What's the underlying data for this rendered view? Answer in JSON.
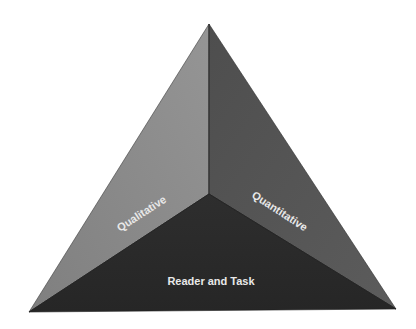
{
  "diagram": {
    "type": "pyramid",
    "faces": [
      {
        "id": "qualitative",
        "label": "Qualitative",
        "color": "#8c8c8c",
        "position": "left"
      },
      {
        "id": "quantitative",
        "label": "Quantitative",
        "color": "#555555",
        "position": "right"
      },
      {
        "id": "reader-and-task",
        "label": "Reader and Task",
        "color": "#2a2a2a",
        "position": "bottom"
      }
    ],
    "label_color": "#e8e8e8",
    "edge_color": "#1e1e1e"
  }
}
